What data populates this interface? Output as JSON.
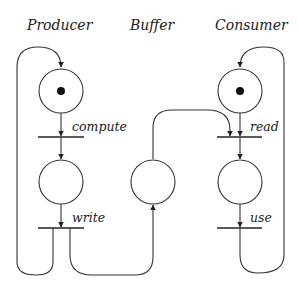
{
  "diagram": {
    "type": "petri-net",
    "columns": {
      "producer": "Producer",
      "buffer": "Buffer",
      "consumer": "Consumer"
    },
    "places": [
      {
        "id": "p_ready_produce",
        "column": "producer",
        "tokens": 1
      },
      {
        "id": "p_ready_write",
        "column": "producer",
        "tokens": 0
      },
      {
        "id": "buffer",
        "column": "buffer",
        "tokens": 0
      },
      {
        "id": "c_ready_read",
        "column": "consumer",
        "tokens": 1
      },
      {
        "id": "c_ready_use",
        "column": "consumer",
        "tokens": 0
      }
    ],
    "transitions": {
      "compute": "compute",
      "write": "write",
      "read": "read",
      "use": "use"
    },
    "arcs": [
      {
        "from": "p_ready_produce",
        "to": "compute"
      },
      {
        "from": "compute",
        "to": "p_ready_write"
      },
      {
        "from": "p_ready_write",
        "to": "write"
      },
      {
        "from": "write",
        "to": "p_ready_produce"
      },
      {
        "from": "write",
        "to": "buffer"
      },
      {
        "from": "buffer",
        "to": "read"
      },
      {
        "from": "c_ready_read",
        "to": "read"
      },
      {
        "from": "read",
        "to": "c_ready_use"
      },
      {
        "from": "c_ready_use",
        "to": "use"
      },
      {
        "from": "use",
        "to": "c_ready_read"
      }
    ],
    "colors": {
      "stroke": "#333333",
      "token": "#111111",
      "background": "#ffffff"
    }
  }
}
